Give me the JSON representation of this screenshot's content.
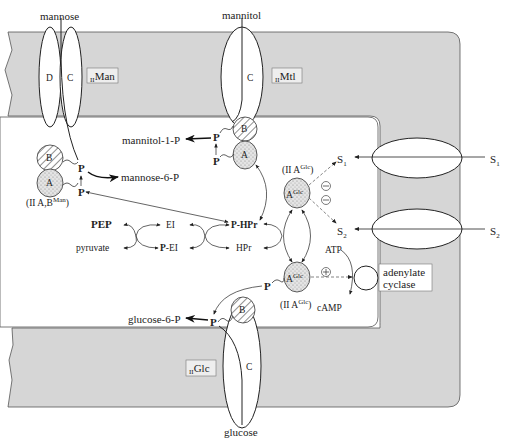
{
  "diagram": {
    "type": "PTS sugar transport / membrane diagram",
    "colors": {
      "membrane": "#d6d6d6",
      "outline": "#333333",
      "cytoplasm": "#ffffff",
      "stipple": "#bdbdbd"
    }
  },
  "substrates": {
    "mannose": "mannose",
    "mannitol": "mannitol",
    "glucose": "glucose",
    "s1_out": "S",
    "s1_out_sub": "1",
    "s1_in": "S",
    "s1_in_sub": "1",
    "s2_out": "S",
    "s2_out_sub": "2",
    "s2_in": "S",
    "s2_in_sub": "2"
  },
  "membrane_labels": {
    "man_prefix": "II",
    "man_name": "Man",
    "mtl_prefix": "II",
    "mtl_name": "Mtl",
    "glc_prefix": "II",
    "glc_name": "Glc"
  },
  "domains": {
    "D": "D",
    "C": "C",
    "B": "B",
    "A": "A",
    "AGlc": "A",
    "AGlc_sup": "Glc"
  },
  "products": {
    "mannitol_1_p": "mannitol-1-P",
    "mannose_6_p": "mannose-6-P",
    "glucose_6_p": "glucose-6-P"
  },
  "complex_labels": {
    "iiab_man_prefix": "(II A,B",
    "iiab_man_sup": "Man",
    "iiab_man_suffix": ")",
    "iia_glc_top_prefix": "(II A",
    "iia_glc_top_sup": "Glc",
    "iia_glc_top_suffix": ")",
    "iia_glc_bot_prefix": "(II A",
    "iia_glc_bot_sup": "Glc",
    "iia_glc_bot_suffix": ")"
  },
  "phospho": {
    "P": "P"
  },
  "cycle": {
    "pep": "PEP",
    "pyruvate": "pyruvate",
    "ei": "EI",
    "p_ei_prefix": "P",
    "p_ei": "-EI",
    "p_hpr_prefix": "P",
    "p_hpr": "-HPr",
    "hpr": "HPr"
  },
  "regulation": {
    "inhibit": "−",
    "activate": "+",
    "atp": "ATP",
    "camp": "cAMP",
    "adenylate_cyclase_line1": "adenylate",
    "adenylate_cyclase_line2": "cyclase"
  }
}
